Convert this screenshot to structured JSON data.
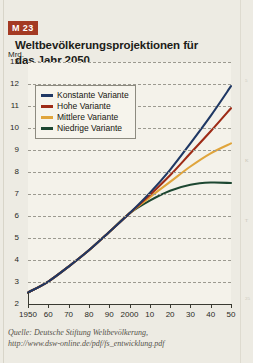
{
  "header": {
    "badge": "M 23",
    "title": "Weltbevölkerungsprojektionen für das Jahr 2050"
  },
  "source": {
    "line1": "Quelle: Deutsche Stiftung Weltbevölkerung,",
    "line2": "http://www.dsw-online.de/pdf/fs_entwicklung.pdf"
  },
  "margin_marks": [
    {
      "text": "5",
      "top": 78
    },
    {
      "text": "K",
      "top": 158
    },
    {
      "text": "T",
      "top": 218
    },
    {
      "text": "25",
      "top": 296
    }
  ],
  "colors": {
    "badge": "#a43a23",
    "konstante": "#1f3864",
    "hohe": "#9e2b16",
    "mittlere": "#e0a53c",
    "niedrige": "#1d4731",
    "plot_bg": "#f4f2ea",
    "page_bg": "#edebe3",
    "grid": "#9c9a90",
    "axis": "#3a3a32"
  },
  "chart_data": {
    "type": "line",
    "title": "Weltbevölkerungsprojektionen für das Jahr 2050",
    "xlabel": "",
    "ylabel": "Mrd.",
    "ylim": [
      2,
      13
    ],
    "xlim": [
      1950,
      2050
    ],
    "grid": true,
    "legend_position": "top-left",
    "ytick_labels": [
      "13",
      "12",
      "11",
      "10",
      "9",
      "8",
      "7",
      "6",
      "5",
      "4",
      "3",
      "2"
    ],
    "ytick_values": [
      13,
      12,
      11,
      10,
      9,
      8,
      7,
      6,
      5,
      4,
      3,
      2
    ],
    "xtick_labels": [
      "1950",
      "60",
      "70",
      "80",
      "90",
      "2000",
      "10",
      "20",
      "30",
      "40",
      "50"
    ],
    "xtick_values": [
      1950,
      1960,
      1970,
      1980,
      1990,
      2000,
      2010,
      2020,
      2030,
      2040,
      2050
    ],
    "x": [
      1950,
      1960,
      1970,
      1980,
      1990,
      2000,
      2010,
      2020,
      2030,
      2040,
      2050
    ],
    "series": [
      {
        "name": "Konstante Variante",
        "color": "#1f3864",
        "values": [
          2.52,
          3.02,
          3.7,
          4.44,
          5.27,
          6.12,
          7.05,
          8.1,
          9.3,
          10.55,
          11.9
        ]
      },
      {
        "name": "Hohe Variante",
        "color": "#9e2b16",
        "values": [
          2.52,
          3.02,
          3.7,
          4.44,
          5.27,
          6.12,
          6.95,
          7.85,
          8.85,
          9.85,
          10.9
        ]
      },
      {
        "name": "Mittlere Variante",
        "color": "#e0a53c",
        "values": [
          2.52,
          3.02,
          3.7,
          4.44,
          5.27,
          6.12,
          6.85,
          7.55,
          8.25,
          8.85,
          9.3
        ]
      },
      {
        "name": "Niedrige Variante",
        "color": "#1d4731",
        "values": [
          2.52,
          3.02,
          3.7,
          4.44,
          5.27,
          6.12,
          6.7,
          7.15,
          7.42,
          7.52,
          7.5
        ]
      }
    ]
  }
}
